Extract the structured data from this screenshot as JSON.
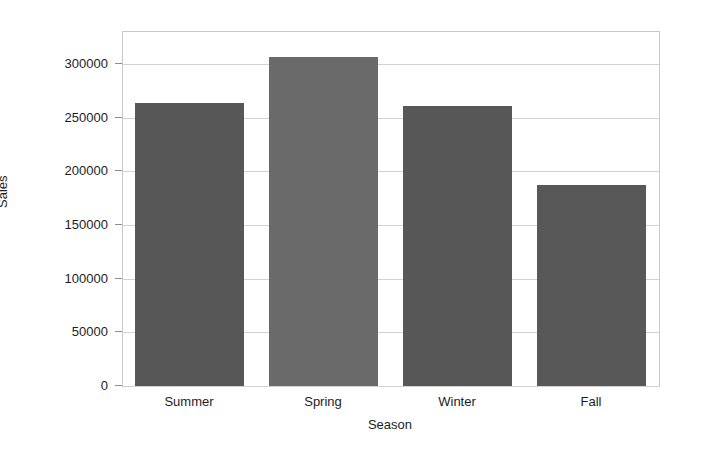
{
  "chart_data": {
    "type": "bar",
    "title": "",
    "xlabel": "Season",
    "ylabel": "Sales",
    "categories": [
      "Summer",
      "Spring",
      "Winter",
      "Fall"
    ],
    "values": [
      264000,
      307000,
      261000,
      187000
    ],
    "ylim": [
      0,
      330000
    ],
    "yticks": [
      0,
      50000,
      100000,
      150000,
      200000,
      250000,
      300000
    ],
    "ytick_labels": [
      "0",
      "50000",
      "100000",
      "150000",
      "200000",
      "250000",
      "300000"
    ],
    "grid": true,
    "legend": "none",
    "bar_colors": [
      "#575757",
      "#6a6a6a",
      "#575757",
      "#585858"
    ],
    "background_color": "#ffffff",
    "gridline_color": "#d2d2d2",
    "axis_color": "#c9c9c9"
  }
}
